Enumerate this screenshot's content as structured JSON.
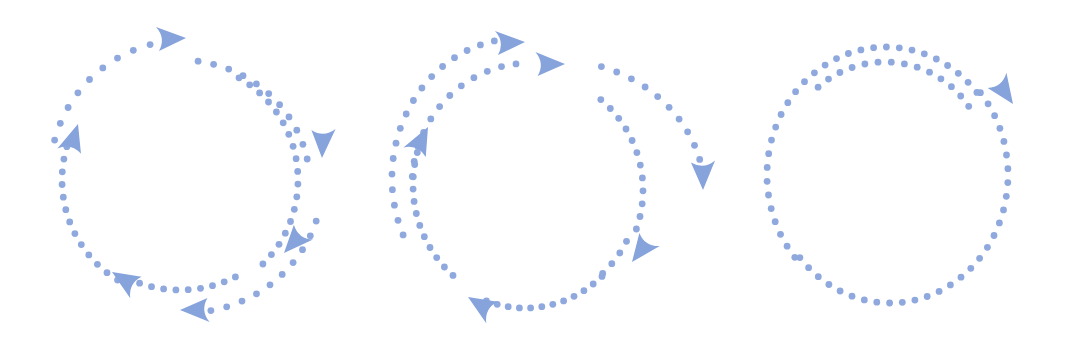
{
  "colors": {
    "dot": "#8fa9de",
    "arrow": "#86a3dc",
    "background": "#ffffff"
  },
  "dot_radius": 3.4,
  "icons": [
    {
      "name": "cycle-icon-multi-arrow",
      "arcs": [
        {
          "cx": 185,
          "cy": 175,
          "rx": 135,
          "ry": 135,
          "from": 195,
          "to": 263,
          "step": 7.5
        },
        {
          "cx": 180,
          "cy": 185,
          "rx": 130,
          "ry": 125,
          "from": 278,
          "to": 350,
          "step": 7.0
        },
        {
          "cx": 180,
          "cy": 180,
          "rx": 118,
          "ry": 118,
          "from": 300,
          "to": 410,
          "step": 6.2
        },
        {
          "cx": 180,
          "cy": 178,
          "rx": 118,
          "ry": 112,
          "from": 62,
          "to": 112,
          "step": 6.0
        },
        {
          "cx": 180,
          "cy": 180,
          "rx": 118,
          "ry": 118,
          "from": 122,
          "to": 200,
          "step": 6.2
        },
        {
          "cx": 185,
          "cy": 180,
          "rx": 138,
          "ry": 133,
          "from": 18,
          "to": 80,
          "step": 6.8
        }
      ],
      "arrows": [
        {
          "x": 186,
          "y": 38,
          "angle": 0
        },
        {
          "x": 322,
          "y": 158,
          "angle": 95
        },
        {
          "x": 284,
          "y": 253,
          "angle": 135
        },
        {
          "x": 112,
          "y": 272,
          "angle": 215
        },
        {
          "x": 78,
          "y": 124,
          "angle": 290
        },
        {
          "x": 180,
          "y": 310,
          "angle": 182
        }
      ]
    },
    {
      "name": "cycle-icon-double-arrow",
      "arcs": [
        {
          "cx": 520,
          "cy": 178,
          "rx": 128,
          "ry": 140,
          "from": 156,
          "to": 262,
          "step": 6.4
        },
        {
          "cx": 530,
          "cy": 185,
          "rx": 118,
          "ry": 122,
          "from": 184,
          "to": 264,
          "step": 7.2
        },
        {
          "cx": 555,
          "cy": 195,
          "rx": 150,
          "ry": 135,
          "from": 288,
          "to": 355,
          "step": 6.3
        },
        {
          "cx": 525,
          "cy": 190,
          "rx": 118,
          "ry": 118,
          "from": 310,
          "to": 380,
          "step": 6.3
        },
        {
          "cx": 525,
          "cy": 185,
          "rx": 115,
          "ry": 120,
          "from": 388,
          "to": 410,
          "step": 6.5
        },
        {
          "cx": 525,
          "cy": 185,
          "rx": 115,
          "ry": 123,
          "from": 48,
          "to": 114,
          "step": 5.6
        },
        {
          "cx": 525,
          "cy": 185,
          "rx": 112,
          "ry": 118,
          "from": 130,
          "to": 200,
          "step": 6.0
        }
      ],
      "arrows": [
        {
          "x": 525,
          "y": 42,
          "angle": 0
        },
        {
          "x": 565,
          "y": 64,
          "angle": 2
        },
        {
          "x": 703,
          "y": 190,
          "angle": 92
        },
        {
          "x": 632,
          "y": 262,
          "angle": 130
        },
        {
          "x": 468,
          "y": 297,
          "angle": 215
        },
        {
          "x": 428,
          "y": 127,
          "angle": 300
        }
      ]
    },
    {
      "name": "cycle-icon-single-arrow",
      "arcs": [
        {
          "cx": 886,
          "cy": 175,
          "rx": 119,
          "ry": 128,
          "from": 140,
          "to": 320,
          "step": -6.2
        },
        {
          "cx": 886,
          "cy": 175,
          "rx": 119,
          "ry": 128,
          "from": 140,
          "to": 320,
          "step": 0
        },
        {
          "cx": 890,
          "cy": 175,
          "rx": 118,
          "ry": 128,
          "from": -40,
          "to": 140,
          "step": 6.2
        },
        {
          "cx": 885,
          "cy": 160,
          "rx": 100,
          "ry": 98,
          "from": 228,
          "to": 330,
          "step": 7.6
        }
      ],
      "arrows": [
        {
          "x": 1013,
          "y": 104,
          "angle": 58
        }
      ]
    }
  ]
}
